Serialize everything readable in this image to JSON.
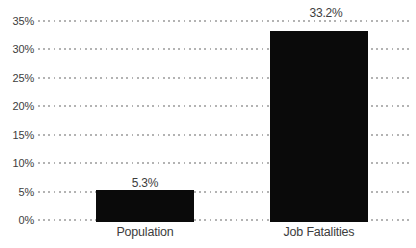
{
  "chart_data": {
    "type": "bar",
    "categories": [
      "Population",
      "Job Fatalities"
    ],
    "values": [
      5.3,
      33.2
    ],
    "value_labels": [
      "5.3%",
      "33.2%"
    ],
    "ylim": [
      0,
      35
    ],
    "yticks": [
      0,
      5,
      10,
      15,
      20,
      25,
      30,
      35
    ],
    "ytick_labels": [
      "0%",
      "5%",
      "10%",
      "15%",
      "20%",
      "25%",
      "30%",
      "35%"
    ],
    "grid": "horizontal-dotted",
    "legend": "none",
    "colors": {
      "bar": "#0a0a0a",
      "text": "#3d3d3d",
      "gridline": "#b3b3b3",
      "background": "#ffffff"
    }
  }
}
